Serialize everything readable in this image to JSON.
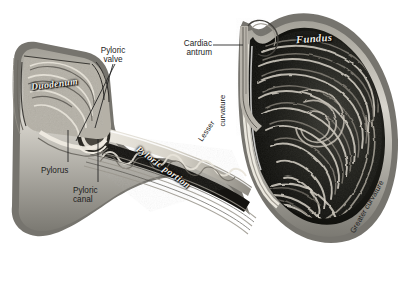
{
  "figure": {
    "background_color": "#ffffff",
    "ink_color": "#1d1d1d",
    "style": "grayscale halftone anatomical engraving"
  },
  "callouts": [
    {
      "id": "pyloric-valve",
      "lines": [
        "Pyloric",
        "valve"
      ],
      "x": 99,
      "y": 46
    },
    {
      "id": "cardiac-antrum",
      "lines": [
        "Cardiac",
        "antrum"
      ],
      "x": 176,
      "y": 39
    },
    {
      "id": "pylorus",
      "lines": [
        "Pylorus"
      ],
      "x": 41,
      "y": 166
    },
    {
      "id": "pyloric-canal",
      "lines": [
        "Pyloric",
        "canal"
      ],
      "x": 73,
      "y": 186
    }
  ],
  "script_labels": [
    {
      "id": "duodenum",
      "text": "Duodenum",
      "x": 31,
      "y": 79,
      "size": 9.5,
      "rotate": -7
    },
    {
      "id": "fundus",
      "text": "Fundus",
      "x": 296,
      "y": 33,
      "size": 10.5,
      "rotate": -4
    },
    {
      "id": "pyloric-portion",
      "text": "Pyloric portion",
      "x": 137,
      "y": 143,
      "size": 9.5,
      "rotate": 36
    }
  ],
  "curvature_labels": [
    {
      "id": "lesser-curvature",
      "text": "Lesser",
      "x": 200,
      "y": 136,
      "rotate": -56
    },
    {
      "id": "lesser-curvature2",
      "text": "curvature",
      "x": 222,
      "y": 122,
      "rotate": -90
    },
    {
      "id": "greater-curvature",
      "text": "Greater curvature",
      "x": 352,
      "y": 228,
      "rotate": -60
    }
  ],
  "colors": {
    "wall_outer": "#8c8c8c",
    "wall_mid": "#d8d5cd",
    "lumen_dark": "#14140f",
    "rugae_light": "#cfcac0",
    "serosa_line": "#3a3a36",
    "highlight": "#f4f2ec"
  }
}
